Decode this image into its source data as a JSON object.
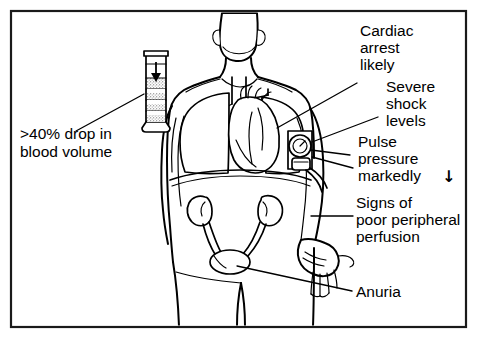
{
  "figure": {
    "border_color": "#1a1a1a",
    "ink_color": "#000000",
    "background_color": "#ffffff"
  },
  "annotations": [
    {
      "id": "blood-volume",
      "lines": [
        ">40% drop in",
        "blood volume"
      ],
      "side": "left",
      "points_to": "graduated-cylinder"
    },
    {
      "id": "cardiac-arrest",
      "lines": [
        "Cardiac",
        "arrest",
        "likely"
      ],
      "side": "right",
      "points_to": "heart"
    },
    {
      "id": "severe-shock",
      "lines": [
        "Severe",
        "shock",
        "levels"
      ],
      "side": "right",
      "points_to": "blood-pressure-cuff"
    },
    {
      "id": "pulse-pressure",
      "lines": [
        "Pulse",
        "pressure",
        "markedly"
      ],
      "arrow": "↓",
      "side": "right",
      "points_to": "blood-pressure-cuff"
    },
    {
      "id": "poor-perfusion",
      "lines": [
        "Signs of",
        "poor peripheral",
        "perfusion"
      ],
      "side": "right",
      "points_to": "hand"
    },
    {
      "id": "anuria",
      "lines": [
        "Anuria"
      ],
      "side": "right",
      "points_to": "bladder"
    }
  ],
  "anatomy": [
    {
      "id": "head",
      "label": "head"
    },
    {
      "id": "neck",
      "label": "neck"
    },
    {
      "id": "torso",
      "label": "torso"
    },
    {
      "id": "lung-left",
      "label": "left lung"
    },
    {
      "id": "lung-right",
      "label": "right lung"
    },
    {
      "id": "trachea",
      "label": "trachea"
    },
    {
      "id": "heart",
      "label": "heart"
    },
    {
      "id": "diaphragm",
      "label": "diaphragm"
    },
    {
      "id": "kidney-left",
      "label": "left kidney"
    },
    {
      "id": "kidney-right",
      "label": "right kidney"
    },
    {
      "id": "ureter-left",
      "label": "left ureter"
    },
    {
      "id": "ureter-right",
      "label": "right ureter"
    },
    {
      "id": "bladder",
      "label": "bladder"
    },
    {
      "id": "arm-left",
      "label": "left arm"
    },
    {
      "id": "arm-right",
      "label": "right arm"
    },
    {
      "id": "hand",
      "label": "hand"
    },
    {
      "id": "legs",
      "label": "legs"
    }
  ],
  "equipment": [
    {
      "id": "graduated-cylinder",
      "label": "graduated measuring cylinder",
      "fill_level_marker": "↓",
      "bands": 4
    },
    {
      "id": "blood-pressure-cuff",
      "label": "sphygmomanometer cuff with gauge and inflation bulb"
    }
  ]
}
